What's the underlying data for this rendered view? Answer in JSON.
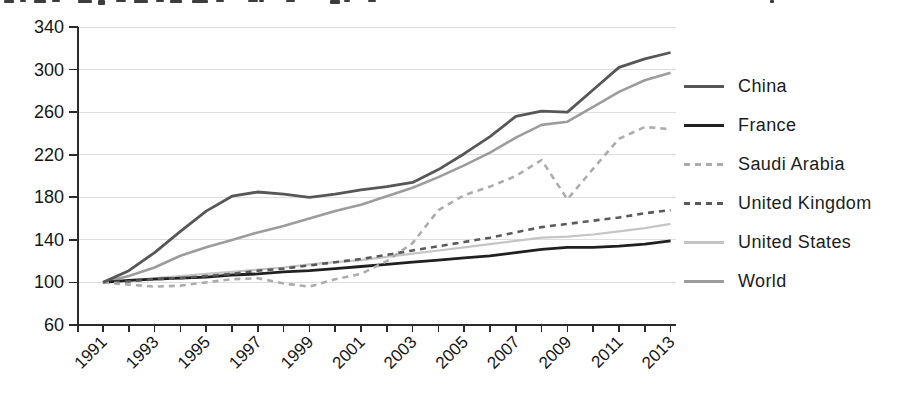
{
  "artifacts": {
    "cropped_illegible_text_along_top_edge": true
  },
  "chart_data": {
    "type": "line",
    "title": "",
    "xlabel": "",
    "ylabel": "",
    "x": [
      1991,
      1992,
      1993,
      1994,
      1995,
      1996,
      1997,
      1998,
      1999,
      2000,
      2001,
      2002,
      2003,
      2004,
      2005,
      2006,
      2007,
      2008,
      2009,
      2010,
      2011,
      2012,
      2013
    ],
    "xtick_labels": [
      "1991",
      "1993",
      "1995",
      "1997",
      "1999",
      "2001",
      "2003",
      "2005",
      "2007",
      "2009",
      "2011",
      "2013"
    ],
    "yticks": [
      60,
      100,
      140,
      180,
      220,
      260,
      300,
      340
    ],
    "ylim": [
      60,
      340
    ],
    "index_base": "1991 = 100",
    "grid": "horizontal",
    "background_color": "#ffffff",
    "axis_color": "#2b2b2b",
    "grid_color": "#dddddd",
    "legend_position": "right",
    "series": [
      {
        "name": "China",
        "color": "#575757",
        "style": "solid",
        "values": [
          100,
          111,
          128,
          148,
          167,
          181,
          185,
          183,
          180,
          183,
          187,
          190,
          194,
          206,
          221,
          237,
          256,
          261,
          260,
          281,
          302,
          310,
          316
        ]
      },
      {
        "name": "France",
        "color": "#202020",
        "style": "solid",
        "values": [
          100,
          102,
          103,
          104,
          105,
          107,
          108,
          110,
          111,
          113,
          115,
          117,
          119,
          121,
          123,
          125,
          128,
          131,
          133,
          133,
          134,
          136,
          139
        ]
      },
      {
        "name": "Saudi Arabia",
        "color": "#acacac",
        "style": "dashed",
        "values": [
          100,
          98,
          96,
          97,
          100,
          103,
          104,
          99,
          96,
          103,
          108,
          120,
          137,
          168,
          182,
          190,
          200,
          215,
          178,
          207,
          235,
          246,
          244
        ]
      },
      {
        "name": "United Kingdom",
        "color": "#5a5a5a",
        "style": "dashed",
        "values": [
          100,
          101,
          103,
          104,
          106,
          108,
          111,
          113,
          116,
          119,
          122,
          126,
          130,
          134,
          138,
          142,
          147,
          152,
          155,
          158,
          161,
          165,
          168
        ]
      },
      {
        "name": "United States",
        "color": "#c5c5c5",
        "style": "solid",
        "values": [
          100,
          102,
          104,
          106,
          108,
          110,
          112,
          114,
          117,
          119,
          121,
          124,
          127,
          130,
          133,
          136,
          139,
          142,
          143,
          145,
          148,
          151,
          155
        ]
      },
      {
        "name": "World",
        "color": "#9c9c9c",
        "style": "solid",
        "values": [
          100,
          106,
          114,
          125,
          133,
          140,
          147,
          153,
          160,
          167,
          173,
          181,
          189,
          199,
          210,
          222,
          236,
          248,
          251,
          265,
          279,
          290,
          297
        ]
      }
    ]
  }
}
